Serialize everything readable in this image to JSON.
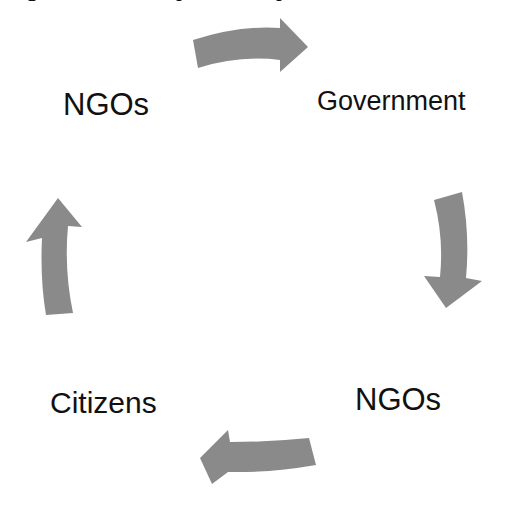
{
  "diagram": {
    "type": "cycle",
    "arrow_color": "#8a8a8a",
    "text_color": "#111111",
    "nodes": [
      {
        "id": "ngos_top",
        "label": "NGOs"
      },
      {
        "id": "government",
        "label": "Government"
      },
      {
        "id": "ngos_bottom",
        "label": "NGOs"
      },
      {
        "id": "citizens",
        "label": "Citizens"
      }
    ],
    "edges": [
      {
        "from": "ngos_top",
        "to": "government",
        "direction": "right"
      },
      {
        "from": "government",
        "to": "ngos_bottom",
        "direction": "down"
      },
      {
        "from": "ngos_bottom",
        "to": "citizens",
        "direction": "left"
      },
      {
        "from": "citizens",
        "to": "ngos_top",
        "direction": "up"
      }
    ]
  }
}
